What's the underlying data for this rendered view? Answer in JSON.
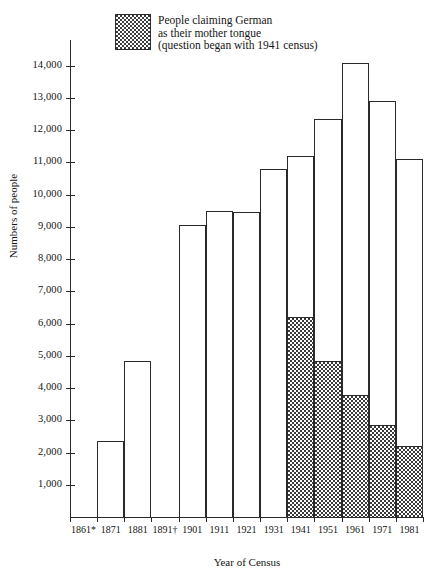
{
  "chart_data": {
    "type": "bar",
    "title": "",
    "xlabel": "Year of Census",
    "ylabel": "Numbers of people",
    "ylim": [
      0,
      14800
    ],
    "ytick_labels": [
      "14,000",
      "13,000",
      "12,000",
      "11,000",
      "10,000",
      "9,000",
      "8,000",
      "7,000",
      "6,000",
      "5,000",
      "4,000",
      "3,000",
      "2,000",
      "1,000"
    ],
    "ytick_values": [
      14000,
      13000,
      12000,
      11000,
      10000,
      9000,
      8000,
      7000,
      6000,
      5000,
      4000,
      3000,
      2000,
      1000
    ],
    "grid": false,
    "categories": [
      "1861*",
      "1871",
      "1881",
      "1891†",
      "1901",
      "1911",
      "1921",
      "1931",
      "1941",
      "1951",
      "1961",
      "1971",
      "1981"
    ],
    "series": [
      {
        "name": "Total",
        "values": [
          null,
          2350,
          4850,
          null,
          9050,
          9500,
          9450,
          10800,
          11200,
          12350,
          14100,
          12900,
          11100
        ]
      },
      {
        "name": "People claiming German as their mother tongue",
        "values": [
          null,
          null,
          null,
          null,
          null,
          null,
          null,
          null,
          6200,
          4850,
          3800,
          2850,
          2200
        ]
      }
    ],
    "legend": {
      "position": "top-left",
      "entries": [
        {
          "swatch": "dotted-hatch",
          "line1": "People claiming German",
          "line2": "as their mother tongue",
          "line3": "(question began with 1941 census)"
        }
      ]
    },
    "notes": [
      "1861*",
      "1891†"
    ]
  }
}
